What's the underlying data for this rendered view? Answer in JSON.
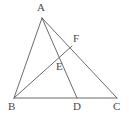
{
  "figure": {
    "kind": "geometry-diagram",
    "canvas": {
      "width": 129,
      "height": 119,
      "background": "#ffffff"
    },
    "stroke": {
      "color": "#6b6b6b",
      "width": 1
    },
    "label_color": "#4a4a4a",
    "points": {
      "A": {
        "label": "A",
        "x": 42,
        "y": 18,
        "label_x": 37,
        "label_y": 2
      },
      "B": {
        "label": "B",
        "x": 14,
        "y": 98,
        "label_x": 8,
        "label_y": 101
      },
      "C": {
        "label": "C",
        "x": 117,
        "y": 98,
        "label_x": 113,
        "label_y": 101
      },
      "D": {
        "label": "D",
        "x": 77,
        "y": 98,
        "label_x": 73,
        "label_y": 101
      },
      "E": {
        "label": "E",
        "x": 63,
        "y": 53,
        "label_x": 56,
        "label_y": 61
      },
      "F": {
        "label": "F",
        "x": 72,
        "y": 46,
        "label_x": 73,
        "label_y": 33
      }
    },
    "segments": [
      {
        "name": "segment-AB",
        "from": "A",
        "to": "B"
      },
      {
        "name": "segment-BC",
        "from": "B",
        "to": "C"
      },
      {
        "name": "segment-AC",
        "from": "A",
        "to": "C"
      },
      {
        "name": "segment-AD",
        "from": "A",
        "to": "D"
      },
      {
        "name": "segment-BF",
        "from": "B",
        "to": "F"
      }
    ]
  }
}
